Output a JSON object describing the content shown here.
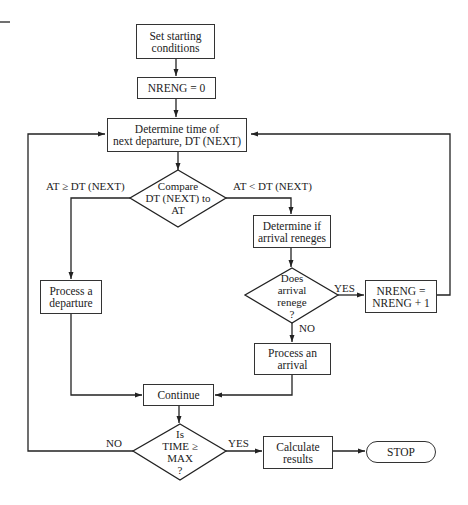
{
  "diagram": {
    "type": "flowchart",
    "nodes": {
      "start": "Set starting\nconditions",
      "init": "NRENG  =  0",
      "next_departure": "Determine time of\nnext departure, DT (NEXT)",
      "compare": "Compare\nDT (NEXT) to\nAT",
      "reneges": "Determine if\narrival reneges",
      "does_renege": "Does\narrival\nrenege\n?",
      "increment": "NRENG  =\nNRENG  +  1",
      "departure": "Process a\ndeparture",
      "arrival": "Process an\narrival",
      "continue": "Continue",
      "time_check": "Is\nTIME ≥\nMAX\n?",
      "calculate": "Calculate\nresults",
      "stop": "STOP"
    },
    "edge_labels": {
      "at_ge": "AT ≥ DT (NEXT)",
      "at_lt": "AT < DT (NEXT)",
      "renege_yes": "YES",
      "renege_no": "NO",
      "time_no": "NO",
      "time_yes": "YES"
    }
  }
}
